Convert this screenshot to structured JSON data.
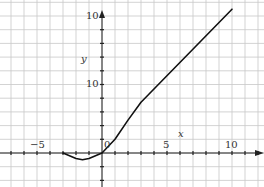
{
  "chart_data": {
    "type": "line",
    "title": "",
    "xlabel": "x",
    "ylabel": "y",
    "xlim": [
      -7.8,
      12.3
    ],
    "ylim": [
      -2.5,
      11
    ],
    "grid": true,
    "legend": null,
    "x_tick_labels": [
      "-5",
      "0",
      "5",
      "10"
    ],
    "y_tick_labels": [
      "10",
      "10"
    ],
    "series": [
      {
        "name": "curve",
        "x": [
          -3,
          -2,
          -1.5,
          -1,
          0,
          1,
          2,
          3,
          10
        ],
        "y": [
          0,
          -0.4,
          -0.5,
          -0.4,
          0,
          1,
          2.4,
          3.7,
          10.5
        ]
      }
    ]
  },
  "labels": {
    "x_axis": "x",
    "y_axis": "y",
    "origin": "0",
    "x_minus5": "−5",
    "x_5": "5",
    "x_10": "10",
    "y_top": "10",
    "y_mid": "10"
  }
}
